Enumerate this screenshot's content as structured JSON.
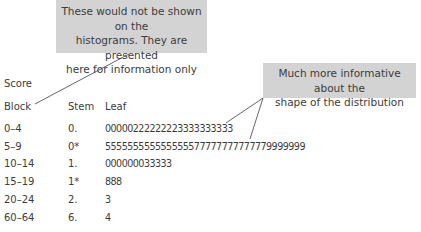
{
  "callouts": {
    "left": {
      "lines": [
        "These would not be shown on the",
        "histograms. They are presented",
        "here for information only"
      ]
    },
    "right": {
      "lines": [
        "Much more informative about the",
        "shape of the distribution"
      ]
    }
  },
  "header": {
    "score": "Score",
    "block": "Block",
    "stem": "Stem",
    "leaf": "Leaf"
  },
  "rows": [
    {
      "block": "0–4",
      "stem": "0.",
      "leaf": "00000222222223333333333"
    },
    {
      "block": "5–9",
      "stem": "0*",
      "leaf": "555555555555555577777777777779999999"
    },
    {
      "block": "10–14",
      "stem": "1.",
      "leaf": "000000033333"
    },
    {
      "block": "15–19",
      "stem": "1*",
      "leaf": "888"
    },
    {
      "block": "20–24",
      "stem": "2.",
      "leaf": "3"
    },
    {
      "block": "60–64",
      "stem": "6.",
      "leaf": "4"
    }
  ],
  "colors": {
    "callout_bg": "#d3d3d3",
    "text": "#3c3c3c",
    "line": "#555555"
  }
}
